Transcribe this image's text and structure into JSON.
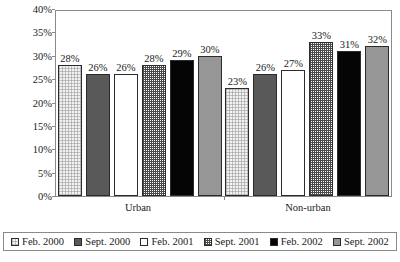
{
  "chart_data": {
    "type": "bar",
    "title": "",
    "xlabel": "",
    "ylabel": "Unemployment rate",
    "categories": [
      "Urban",
      "Non-urban"
    ],
    "ylim": [
      0,
      40
    ],
    "ytick_labels": [
      "40%",
      "35%",
      "30%",
      "25%",
      "20%",
      "15%",
      "10%",
      "5%",
      "0%"
    ],
    "ytick_values": [
      40,
      35,
      30,
      25,
      20,
      15,
      10,
      5,
      0
    ],
    "grid": false,
    "legend_position": "bottom",
    "value_suffix": "%",
    "series": [
      {
        "name": "Feb. 2000",
        "pattern": "pat-dot",
        "values": [
          28,
          23
        ],
        "labels": [
          "28%",
          "23%"
        ]
      },
      {
        "name": "Sept. 2000",
        "pattern": "pat-darkgray",
        "values": [
          26,
          26
        ],
        "labels": [
          "26%",
          "26%"
        ]
      },
      {
        "name": "Feb. 2001",
        "pattern": "pat-white",
        "values": [
          26,
          27
        ],
        "labels": [
          "26%",
          "27%"
        ]
      },
      {
        "name": "Sept. 2001",
        "pattern": "pat-check",
        "values": [
          28,
          33
        ],
        "labels": [
          "28%",
          "33%"
        ]
      },
      {
        "name": "Feb. 2002",
        "pattern": "pat-black",
        "values": [
          29,
          31
        ],
        "labels": [
          "29%",
          "31%"
        ]
      },
      {
        "name": "Sept. 2002",
        "pattern": "pat-midgray",
        "values": [
          30,
          32
        ],
        "labels": [
          "30%",
          "32%"
        ]
      }
    ]
  },
  "colors": {
    "axis": "#8a8a8a",
    "bar_outline": "#2b2b2b",
    "text": "#1a1a1a",
    "series_dot": "#f2f2f2",
    "series_darkgray": "#595959",
    "series_white": "#ffffff",
    "series_check": "#4a4a4a",
    "series_black": "#050505",
    "series_midgray": "#969696"
  }
}
